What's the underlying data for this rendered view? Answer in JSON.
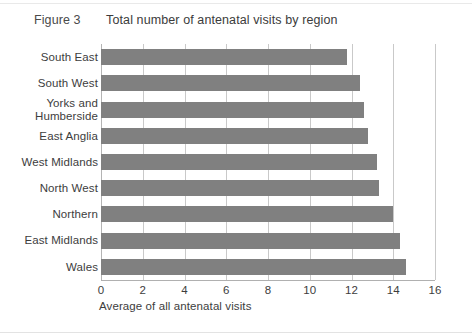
{
  "figure": {
    "label": "Figure 3",
    "title": "Total number of antenatal visits by region"
  },
  "chart_data": {
    "type": "bar",
    "orientation": "horizontal",
    "title": "Total number of antenatal visits by region",
    "xlabel": "Average of all antenatal visits",
    "ylabel": "",
    "xlim": [
      0,
      16
    ],
    "xticks": [
      0,
      2,
      4,
      6,
      8,
      10,
      12,
      14,
      16
    ],
    "grid": true,
    "legend": null,
    "bar_color": "#808080",
    "categories": [
      "South East",
      "South West",
      "Yorks and Humberside",
      "East Anglia",
      "West Midlands",
      "North West",
      "Northern",
      "East Midlands",
      "Wales"
    ],
    "category_lines": [
      [
        "South East"
      ],
      [
        "South West"
      ],
      [
        "Yorks and",
        "Humberside"
      ],
      [
        "East Anglia"
      ],
      [
        "West Midlands"
      ],
      [
        "North West"
      ],
      [
        "Northern"
      ],
      [
        "East Midlands"
      ],
      [
        "Wales"
      ]
    ],
    "values": [
      11.8,
      12.4,
      12.6,
      12.8,
      13.2,
      13.3,
      14.0,
      14.3,
      14.6
    ]
  }
}
